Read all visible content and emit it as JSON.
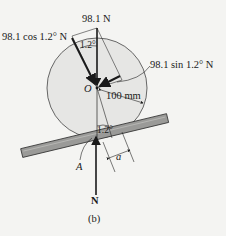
{
  "figure": {
    "caption": "(b)",
    "labels": {
      "weight": "98.1 N",
      "normal_component": "98.1 cos 1.2° N",
      "tangential_component": "98.1 sin 1.2° N",
      "center": "O",
      "radius": "100 mm",
      "angle_top": "1.2°",
      "angle_bottom": "1.2°",
      "contact_point": "A",
      "offset": "a",
      "normal_force": "N"
    },
    "colors": {
      "background": "#f4f4f2",
      "wheel_fill": "#e6e6e4",
      "plank_fill": "#9a9a98",
      "ink": "#1a1a1a"
    }
  }
}
